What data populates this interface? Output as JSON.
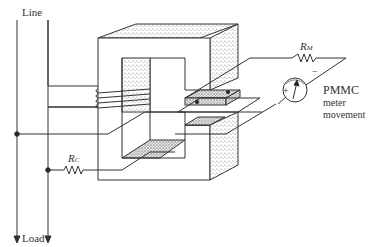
{
  "diagram": {
    "type": "clamp-on current transformer with PMMC meter",
    "labels": {
      "line": "Line",
      "load": "Load",
      "rc_main": "R",
      "rc_sub": "C",
      "rm_main": "R",
      "rm_sub": "M",
      "meter_plus": "+",
      "meter_minus": "−",
      "meter_line1": "PMMC",
      "meter_line2": "meter",
      "meter_line3": "movement"
    },
    "components": [
      {
        "id": "core",
        "name": "magnetic core (C-shaped halves with air gap)"
      },
      {
        "id": "coil",
        "name": "winding on core left limb",
        "turns": 4
      },
      {
        "id": "rc",
        "name": "resistor R_C"
      },
      {
        "id": "rm",
        "name": "resistor R_M"
      },
      {
        "id": "meter",
        "name": "PMMC meter movement"
      },
      {
        "id": "hall-element",
        "name": "element in air gap"
      }
    ],
    "colors": {
      "stroke": "#333333",
      "background": "#ffffff",
      "shade": "#9a9a9a"
    }
  }
}
